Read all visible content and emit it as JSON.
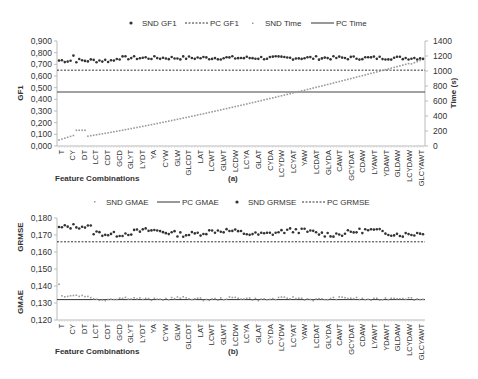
{
  "chart_data": [
    {
      "id": "a",
      "type": "scatter",
      "panel_label": "(a)",
      "xlabel": "Feature Combinations",
      "ylabel": "GF1",
      "y2label": "Time (s)",
      "ylim": [
        0,
        0.9
      ],
      "yticks": [
        "0,000",
        "0,100",
        "0,200",
        "0,300",
        "0,400",
        "0,500",
        "0,600",
        "0,700",
        "0,800",
        "0,900"
      ],
      "y2lim": [
        0,
        1400
      ],
      "y2ticks": [
        "0",
        "200",
        "400",
        "600",
        "800",
        "1000",
        "1200",
        "1400"
      ],
      "categories": [
        "T",
        "CY",
        "DT",
        "LCT",
        "CDT",
        "GCD",
        "GLYT",
        "LYDT",
        "YA",
        "CYW",
        "GLW",
        "GLCDT",
        "LAT",
        "LCWT",
        "GLWT",
        "LCDW",
        "LCYA",
        "GLAT",
        "CYDA",
        "LCYDW",
        "LCYAT",
        "YAW",
        "LCDAT",
        "GLYDA",
        "CAWT",
        "GCYDAT",
        "CDAW",
        "LYAWT",
        "YDAWT",
        "GLDAW",
        "LCYDAW",
        "GLCYAWT"
      ],
      "n_points": 127,
      "legend": [
        {
          "label": "SND GF1",
          "style": "dot-dark"
        },
        {
          "label": "PC GF1",
          "style": "dashed"
        },
        {
          "label": "SND Time",
          "style": "dot-light"
        },
        {
          "label": "PC Time",
          "style": "solid"
        }
      ],
      "series": [
        {
          "name": "SND GF1",
          "axis": "left",
          "mean": 0.755,
          "range": [
            0.7,
            0.78
          ]
        },
        {
          "name": "PC GF1",
          "axis": "left",
          "constant": 0.65
        },
        {
          "name": "SND Time",
          "axis": "right",
          "start": 80,
          "end": 1150,
          "trend": "increasing"
        },
        {
          "name": "PC Time",
          "axis": "right",
          "constant": 720
        }
      ]
    },
    {
      "id": "b",
      "type": "scatter",
      "panel_label": "(b)",
      "xlabel": "Feature Combinations",
      "ylabel_top": "GRMSE",
      "ylabel_bottom": "GMAE",
      "ylim": [
        0.12,
        0.18
      ],
      "yticks": [
        "0,120",
        "0,130",
        "0,140",
        "0,150",
        "0,160",
        "0,170",
        "0,180"
      ],
      "categories": [
        "T",
        "CY",
        "DT",
        "LCT",
        "CDT",
        "GCD",
        "GLYT",
        "LYDT",
        "YA",
        "CYW",
        "GLW",
        "GLCDT",
        "LAT",
        "LCWT",
        "GLWT",
        "LCDW",
        "LCYA",
        "GLAT",
        "CYDA",
        "LCYDW",
        "LCYAT",
        "YAW",
        "LCDAT",
        "GLYDA",
        "CAWT",
        "GCYDAT",
        "CDAW",
        "LYAWT",
        "YDAWT",
        "GLDAW",
        "LCYDAW",
        "GLCYAWT"
      ],
      "n_points": 127,
      "legend": [
        {
          "label": "SND GMAE",
          "style": "dot-light"
        },
        {
          "label": "PC GMAE",
          "style": "solid"
        },
        {
          "label": "SND GRMSE",
          "style": "dot-dark"
        },
        {
          "label": "PC GRMSE",
          "style": "dashed"
        }
      ],
      "series": [
        {
          "name": "SND GMAE",
          "mean": 0.1325,
          "range": [
            0.131,
            0.141
          ]
        },
        {
          "name": "PC GMAE",
          "constant": 0.132
        },
        {
          "name": "SND GRMSE",
          "mean": 0.1715,
          "range": [
            0.17,
            0.176
          ]
        },
        {
          "name": "PC GRMSE",
          "constant": 0.166
        }
      ]
    }
  ]
}
